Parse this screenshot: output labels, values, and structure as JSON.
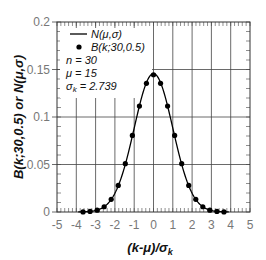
{
  "chart_data": {
    "type": "line",
    "title": "",
    "xlabel": "(k-μ)/σ",
    "xlabel_sub": "k",
    "ylabel": "B(k;30,0.5) or N(μ,σ)",
    "xlim": [
      -5,
      5
    ],
    "ylim": [
      0,
      0.2
    ],
    "x_ticks": [
      -5,
      -4,
      -3,
      -2,
      -1,
      0,
      1,
      2,
      3,
      4,
      5
    ],
    "x_tick_labels": [
      "-5",
      "-4",
      "-3",
      "-2",
      "-1",
      "0",
      "1",
      "2",
      "3",
      "4",
      "5"
    ],
    "y_ticks": [
      0,
      0.05,
      0.1,
      0.15,
      0.2
    ],
    "y_tick_labels": [
      "0",
      "0.05",
      "0.1",
      "0.15",
      "0.2"
    ],
    "grid": true,
    "legend_position": "top-left",
    "series": [
      {
        "name": "N(μ,σ)",
        "kind": "line",
        "color": "#000000",
        "mean": 0,
        "sigma_scaled": 1,
        "peak": 0.1457
      },
      {
        "name": "B(k;30,0.5)",
        "kind": "scatter",
        "color": "#000000",
        "x": [
          -3.651,
          -3.286,
          -2.921,
          -2.556,
          -2.191,
          -1.826,
          -1.461,
          -1.095,
          -0.73,
          -0.365,
          0,
          0.365,
          0.73,
          1.095,
          1.461,
          1.826,
          2.191,
          2.556,
          2.921,
          3.286,
          3.651
        ],
        "y": [
          0.0001,
          0.0006,
          0.0019,
          0.0055,
          0.0133,
          0.028,
          0.0509,
          0.0806,
          0.1115,
          0.1354,
          0.1445,
          0.1354,
          0.1115,
          0.0806,
          0.0509,
          0.028,
          0.0133,
          0.0055,
          0.0019,
          0.0006,
          0.0001
        ]
      }
    ],
    "annotations": {
      "legend_line_label": "N(μ,σ)",
      "legend_dot_label": "B(k;30,0.5)",
      "n_text": "n = 30",
      "mu_text": "μ = 15",
      "sigma_text": "σ",
      "sigma_sub": "k",
      "sigma_value": " = 2.739"
    }
  }
}
